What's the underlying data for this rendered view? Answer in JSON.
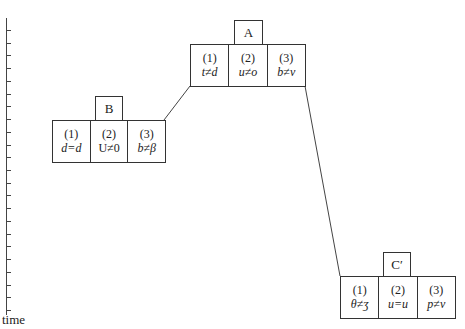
{
  "axis": {
    "label": "time",
    "tick_count": 23
  },
  "nodes": [
    {
      "id": "A",
      "label": "A",
      "cells": [
        {
          "num": "(1)",
          "cond": "t≠d"
        },
        {
          "num": "(2)",
          "cond": "u≠o"
        },
        {
          "num": "(3)",
          "cond": "b≠v"
        }
      ]
    },
    {
      "id": "B",
      "label": "B",
      "cells": [
        {
          "num": "(1)",
          "cond": "d=d"
        },
        {
          "num": "(2)",
          "cond": "U≠0"
        },
        {
          "num": "(3)",
          "cond": "b≠β"
        }
      ]
    },
    {
      "id": "C",
      "label": "C′",
      "cells": [
        {
          "num": "(1)",
          "cond": "θ≠ʒ"
        },
        {
          "num": "(2)",
          "cond": "u=u"
        },
        {
          "num": "(3)",
          "cond": "p≠v"
        }
      ]
    }
  ],
  "edges": [
    {
      "from": "B",
      "to": "A"
    },
    {
      "from": "A",
      "to": "C"
    }
  ],
  "colors": {
    "line": "#444444",
    "background": "#ffffff"
  }
}
